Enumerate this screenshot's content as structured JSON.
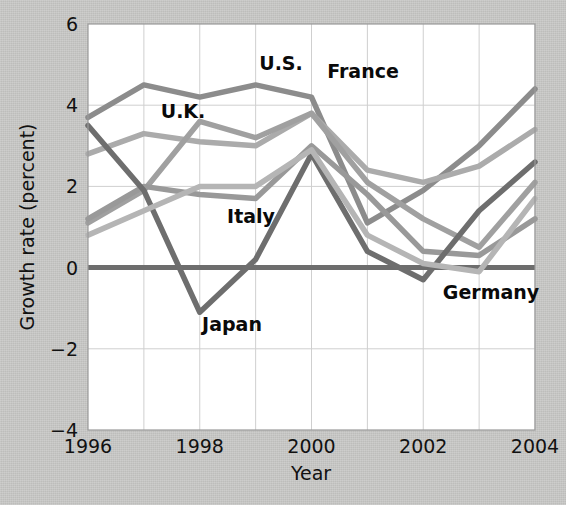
{
  "chart_data": {
    "type": "line",
    "title": "",
    "xlabel": "Year",
    "ylabel": "Growth rate (percent)",
    "x": [
      1996,
      1997,
      1998,
      1999,
      2000,
      2001,
      2002,
      2003,
      2004
    ],
    "xlim": [
      1996,
      2004
    ],
    "ylim": [
      -4,
      6
    ],
    "xticks": [
      1996,
      1998,
      2000,
      2002,
      2004
    ],
    "xtick_labels": [
      "1996",
      "1998",
      "2000",
      "2002",
      "2004"
    ],
    "yticks": [
      -4,
      -2,
      0,
      2,
      4,
      6
    ],
    "ytick_labels": [
      "−4",
      "−2",
      "0",
      "2",
      "4",
      "6"
    ],
    "grid": true,
    "legend": "inline-labels",
    "zero_line": true,
    "series": [
      {
        "name": "U.S.",
        "color": "#8c8c8c",
        "values": [
          3.7,
          4.5,
          4.2,
          4.5,
          4.2,
          1.1,
          1.9,
          3.0,
          4.4
        ]
      },
      {
        "name": "U.K.",
        "color": "#ababab",
        "values": [
          2.8,
          3.3,
          3.1,
          3.0,
          3.8,
          2.4,
          2.1,
          2.5,
          3.4
        ]
      },
      {
        "name": "France",
        "color": "#a0a0a0",
        "values": [
          1.1,
          1.9,
          3.6,
          3.2,
          3.8,
          2.1,
          1.2,
          0.5,
          2.1
        ]
      },
      {
        "name": "Italy",
        "color": "#999999",
        "values": [
          1.2,
          2.0,
          1.8,
          1.7,
          3.0,
          1.8,
          0.4,
          0.3,
          1.2
        ]
      },
      {
        "name": "Japan",
        "color": "#6e6e6e",
        "values": [
          3.5,
          1.9,
          -1.1,
          0.2,
          2.8,
          0.4,
          -0.3,
          1.4,
          2.6
        ]
      },
      {
        "name": "Germany",
        "color": "#b5b5b5",
        "values": [
          0.8,
          1.4,
          2.0,
          2.0,
          2.9,
          0.8,
          0.1,
          -0.1,
          1.7
        ]
      }
    ],
    "series_labels": [
      {
        "name": "U.S.",
        "text": "U.S.",
        "x": 281,
        "y": 70
      },
      {
        "name": "France",
        "text": "France",
        "x": 363,
        "y": 78
      },
      {
        "name": "U.K.",
        "text": "U.K.",
        "x": 183,
        "y": 118
      },
      {
        "name": "Italy",
        "text": "Italy",
        "x": 251,
        "y": 223
      },
      {
        "name": "Japan",
        "text": "Japan",
        "x": 232,
        "y": 331
      },
      {
        "name": "Germany",
        "text": "Germany",
        "x": 491,
        "y": 299
      }
    ]
  },
  "axes": {
    "plot_background": "#ffffff",
    "grid_color": "#cfcfcf",
    "border_color": "#9a9a9a",
    "zero_line_color": "#6d6d6d"
  }
}
